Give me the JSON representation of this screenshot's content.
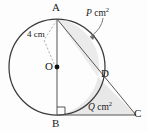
{
  "figure": {
    "background_color": "#fdfdfd",
    "stroke_color": "#3a3a3a",
    "shade_color": "#e6e6e6",
    "labels": {
      "vertex_a": "A",
      "vertex_b": "B",
      "vertex_c": "C",
      "vertex_d": "D",
      "center_o": "O",
      "radius_measure": "4 cm",
      "region_p_var": "P",
      "region_p_unit": "cm",
      "region_p_exponent": "2",
      "region_q_var": "Q",
      "region_q_unit": "cm",
      "region_q_exponent": "2"
    },
    "geometry": {
      "circle_center_x": 57,
      "circle_center_y": 67,
      "circle_radius": 48,
      "point_a_x": 57,
      "point_a_y": 19,
      "point_b_x": 57,
      "point_b_y": 115,
      "point_c_x": 136,
      "point_c_y": 115,
      "point_d_x": 98,
      "point_d_y": 77,
      "right_angle_at": "B"
    },
    "annotations": {
      "right_angle_marker": "square",
      "radius_line_style": "dashed",
      "p_arrow": "curved-pointer",
      "center_dot": true
    }
  }
}
